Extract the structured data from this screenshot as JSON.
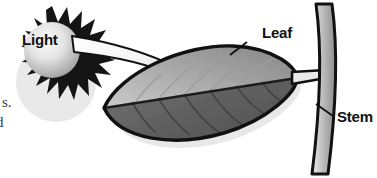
{
  "figure": {
    "background_color": "#ffffff",
    "width": 377,
    "height": 178
  },
  "labels": {
    "light": "Light",
    "leaf": "Leaf",
    "stem": "Stem"
  },
  "margin_text": {
    "line_1": "s.",
    "line_2": "d"
  },
  "colors": {
    "outline": "#111111",
    "sun_rays": "#151515",
    "sun_disc_light": "#f2f2f2",
    "sun_disc_dark": "#9a9a9a",
    "beam_light": "#fdfdfd",
    "beam_dark": "#d6d6d6",
    "leaf_upper_light": "#d8d8d8",
    "leaf_upper_dark": "#8e8e8e",
    "leaf_lower_light": "#7c7c7c",
    "leaf_lower_dark": "#545454",
    "stem_light": "#e6e6e6",
    "stem_dark": "#8a8a8a",
    "shadow": "#c9c9c9"
  },
  "icons": {
    "sun": "sun-icon",
    "leaf": "leaf-icon",
    "stem": "stem-icon",
    "beam_arrow": "arrow-icon",
    "leaf_leader": "leader-line-icon",
    "stem_leader": "leader-line-icon"
  }
}
